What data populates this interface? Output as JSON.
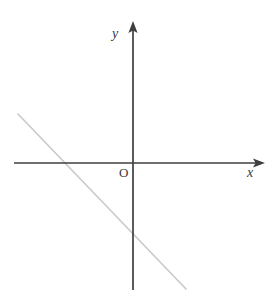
{
  "figure": {
    "kind": "cartesian-coordinate-plane-with-line",
    "width": 277,
    "height": 307,
    "background_color": "#ffffff"
  },
  "labels": {
    "y_axis": "y",
    "x_axis": "x",
    "origin": "O"
  },
  "colors": {
    "axis": "#3f3f3f",
    "line": "#c9c9c9",
    "text": "#3a3a3a",
    "background": "#ffffff"
  },
  "chart_data": {
    "type": "line",
    "title": "",
    "xlabel": "x",
    "ylabel": "y",
    "grid": false,
    "legend": null,
    "origin_label": "O",
    "axes": {
      "x_axis": {
        "start_px": [
          14,
          163
        ],
        "end_px": [
          265,
          163
        ],
        "arrow_at": "end",
        "label": "x",
        "label_px": [
          247,
          166
        ]
      },
      "y_axis": {
        "start_px": [
          133,
          290
        ],
        "end_px": [
          133,
          21
        ],
        "arrow_at": "end",
        "label": "y",
        "label_px": [
          112,
          27
        ]
      },
      "origin_px": [
        133,
        163
      ]
    },
    "series": [
      {
        "name": "line",
        "color": "#c9c9c9",
        "slope": -1,
        "x_intercept_px": [
          62,
          163
        ],
        "y_intercept_px": [
          133,
          232
        ],
        "start_px": [
          18,
          114
        ],
        "end_px": [
          186,
          289
        ],
        "points_px": [
          [
            18,
            114
          ],
          [
            186,
            289
          ]
        ]
      }
    ]
  }
}
